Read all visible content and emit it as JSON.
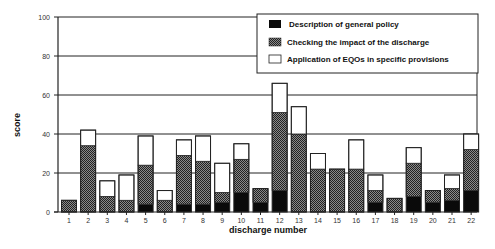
{
  "chart_data": {
    "type": "bar",
    "stacked": true,
    "title": "",
    "xlabel": "discharge number",
    "ylabel": "score",
    "ylim": [
      0,
      100
    ],
    "yticks": [
      0,
      20,
      40,
      60,
      80,
      100
    ],
    "grid": {
      "horizontal": true,
      "vertical": false
    },
    "legend_position": "top-right",
    "categories": [
      "1",
      "2",
      "3",
      "4",
      "5",
      "6",
      "7",
      "8",
      "9",
      "10",
      "11",
      "12",
      "13",
      "14",
      "15",
      "16",
      "17",
      "18",
      "19",
      "20",
      "21",
      "22"
    ],
    "series": [
      {
        "name": "Description of general policy",
        "fill": "black",
        "values": [
          0,
          0,
          0,
          0,
          4,
          0,
          4,
          4,
          5,
          10,
          5,
          11,
          0,
          0,
          0,
          0,
          5,
          0,
          8,
          5,
          6,
          11
        ]
      },
      {
        "name": "Checking the impact of the discharge",
        "fill": "hatched",
        "values": [
          6,
          34,
          8,
          6,
          20,
          6,
          25,
          22,
          5,
          17,
          7,
          40,
          40,
          22,
          22,
          22,
          6,
          7,
          17,
          6,
          6,
          21
        ]
      },
      {
        "name": "Application of EQOs in specific provisions",
        "fill": "white",
        "values": [
          0,
          8,
          8,
          13,
          15,
          5,
          8,
          13,
          15,
          8,
          0,
          15,
          14,
          8,
          0,
          15,
          8,
          0,
          8,
          0,
          7,
          8
        ]
      }
    ],
    "totals": [
      6,
      42,
      16,
      19,
      39,
      11,
      37,
      39,
      25,
      35,
      12,
      66,
      54,
      30,
      22,
      37,
      19,
      7,
      33,
      11,
      19,
      40
    ]
  },
  "colors": {
    "black": "#0a0a0a",
    "hatch_dark": "#2a2a2a",
    "hatch_light": "#8a8a8a",
    "white": "#ffffff",
    "axis": "#222222"
  }
}
